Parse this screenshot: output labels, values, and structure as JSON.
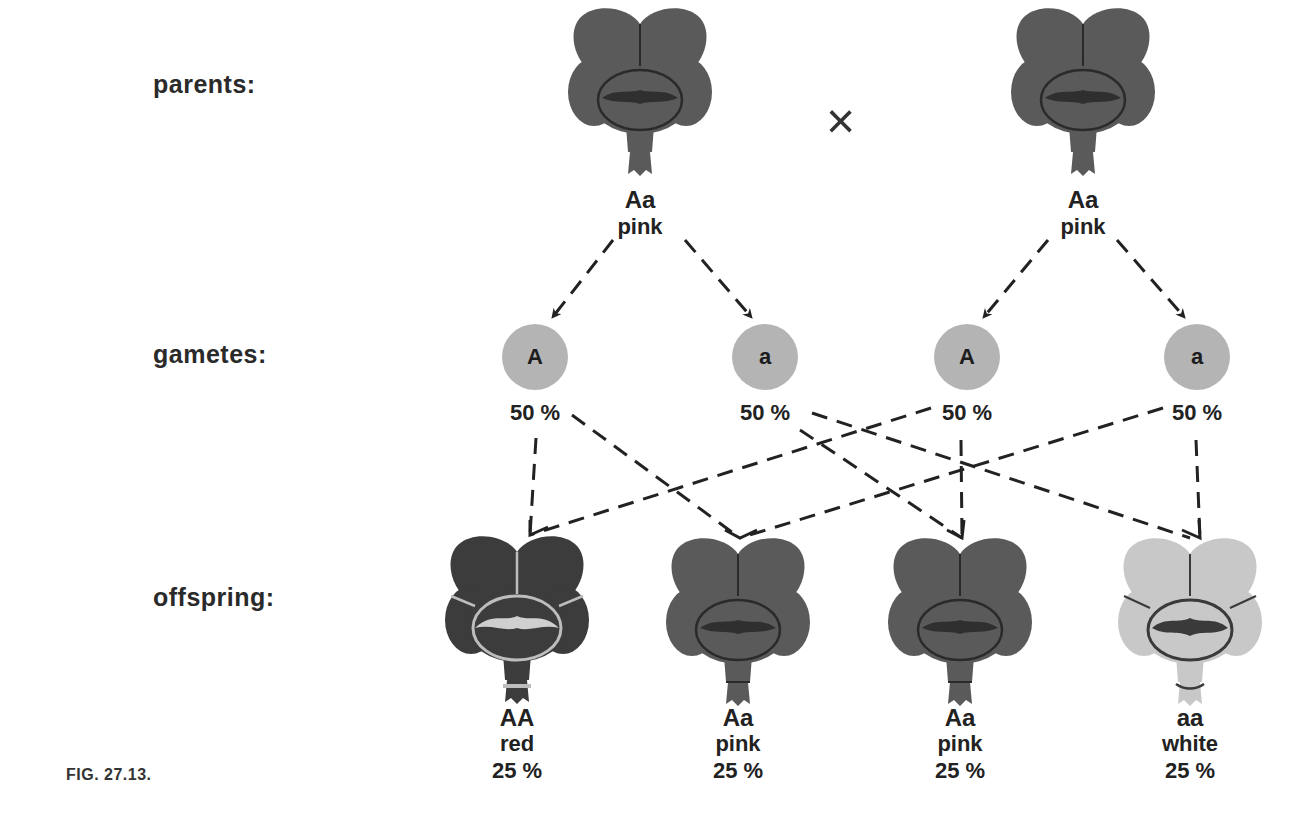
{
  "figure": {
    "caption": "FIG. 27.13."
  },
  "row_labels": {
    "parents": "parents:",
    "gametes": "gametes:",
    "offspring": "offspring:"
  },
  "cross_symbol": "×",
  "parents": [
    {
      "genotype": "Aa",
      "phenotype": "pink",
      "color": "#5a5a5a"
    },
    {
      "genotype": "Aa",
      "phenotype": "pink",
      "color": "#5a5a5a"
    }
  ],
  "gametes": [
    {
      "allele": "A",
      "percent": "50 %"
    },
    {
      "allele": "a",
      "percent": "50 %"
    },
    {
      "allele": "A",
      "percent": "50 %"
    },
    {
      "allele": "a",
      "percent": "50 %"
    }
  ],
  "offspring": [
    {
      "genotype": "AA",
      "phenotype": "red",
      "percent": "25 %",
      "color": "#3c3c3c"
    },
    {
      "genotype": "Aa",
      "phenotype": "pink",
      "percent": "25 %",
      "color": "#5a5a5a"
    },
    {
      "genotype": "Aa",
      "phenotype": "pink",
      "percent": "25 %",
      "color": "#5a5a5a"
    },
    {
      "genotype": "aa",
      "phenotype": "white",
      "percent": "25 %",
      "color": "#c8c8c8"
    }
  ],
  "colors": {
    "gamete_fill": "#b4b4b4",
    "line": "#222222"
  }
}
